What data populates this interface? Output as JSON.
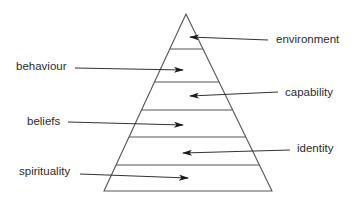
{
  "diagram": {
    "type": "pyramid",
    "colors": {
      "line": "#555555",
      "text": "#2b2b2b",
      "background": "#ffffff"
    },
    "pyramid": {
      "apex": [
        186,
        14
      ],
      "base_left": [
        104,
        191
      ],
      "base_right": [
        272,
        191
      ],
      "divider_ys": [
        49,
        82,
        110,
        137,
        165
      ]
    },
    "labels": [
      {
        "text": "environment",
        "side": "right",
        "x": 276,
        "y": 34,
        "arrow": {
          "from": [
            268,
            40
          ],
          "to": [
            190,
            37
          ]
        }
      },
      {
        "text": "behaviour",
        "side": "left",
        "x": 16,
        "y": 61,
        "arrow": {
          "from": [
            75,
            68
          ],
          "to": [
            183,
            70
          ]
        }
      },
      {
        "text": "capability",
        "side": "right",
        "x": 285,
        "y": 87,
        "arrow": {
          "from": [
            278,
            92
          ],
          "to": [
            190,
            96
          ]
        }
      },
      {
        "text": "beliefs",
        "side": "left",
        "x": 27,
        "y": 116,
        "arrow": {
          "from": [
            68,
            122
          ],
          "to": [
            183,
            125
          ]
        }
      },
      {
        "text": "identity",
        "side": "right",
        "x": 297,
        "y": 143,
        "arrow": {
          "from": [
            290,
            150
          ],
          "to": [
            183,
            153
          ]
        }
      },
      {
        "text": "spirituality",
        "side": "left",
        "x": 19,
        "y": 166,
        "arrow": {
          "from": [
            80,
            174
          ],
          "to": [
            188,
            178
          ]
        }
      }
    ]
  }
}
